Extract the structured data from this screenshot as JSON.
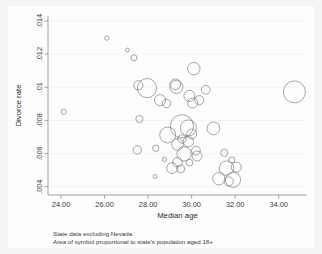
{
  "chart_data": {
    "type": "scatter",
    "title": "",
    "xlabel": "Median age",
    "ylabel": "Divorce rate",
    "xlim": [
      23.4,
      35.3
    ],
    "ylim": [
      0.0035,
      0.0143
    ],
    "xticks": [
      "24.00",
      "26.00",
      "28.00",
      "30.00",
      "32.00",
      "34.00"
    ],
    "xtick_values": [
      24,
      26,
      28,
      30,
      32,
      34
    ],
    "yticks": [
      ".014",
      ".012",
      ".01",
      ".008",
      ".006",
      ".004"
    ],
    "ytick_values": [
      0.014,
      0.012,
      0.01,
      0.008,
      0.006,
      0.004
    ],
    "grid": true,
    "legend": "none",
    "size_encoding": "Area of symbol proportional to state's population aged 18+",
    "notes": [
      "State data excluding Nevada",
      "Area of symbol proportional to state's population aged 18+"
    ],
    "marker": "open-circle",
    "marker_color": "#6f6f74",
    "background_color": "#f4f4f4",
    "plot_background_color": "#fdfdfd",
    "points": [
      {
        "x": 26.1,
        "y": 0.01297,
        "r": 2.2
      },
      {
        "x": 27.05,
        "y": 0.01225,
        "r": 1.9
      },
      {
        "x": 27.35,
        "y": 0.01178,
        "r": 3.0
      },
      {
        "x": 30.1,
        "y": 0.01112,
        "r": 6.2
      },
      {
        "x": 27.55,
        "y": 0.01012,
        "r": 4.6
      },
      {
        "x": 27.95,
        "y": 0.00995,
        "r": 9.6
      },
      {
        "x": 29.25,
        "y": 0.01018,
        "r": 5.4
      },
      {
        "x": 29.3,
        "y": 0.01002,
        "r": 6.6
      },
      {
        "x": 30.65,
        "y": 0.00985,
        "r": 4.4
      },
      {
        "x": 34.72,
        "y": 0.00972,
        "r": 11.0
      },
      {
        "x": 29.9,
        "y": 0.00948,
        "r": 5.6
      },
      {
        "x": 30.35,
        "y": 0.00922,
        "r": 4.6
      },
      {
        "x": 28.55,
        "y": 0.00922,
        "r": 5.6
      },
      {
        "x": 28.85,
        "y": 0.00902,
        "r": 4.2
      },
      {
        "x": 30.05,
        "y": 0.00905,
        "r": 5.0
      },
      {
        "x": 24.12,
        "y": 0.00852,
        "r": 2.6
      },
      {
        "x": 27.6,
        "y": 0.00808,
        "r": 3.6
      },
      {
        "x": 29.55,
        "y": 0.00765,
        "r": 11.6
      },
      {
        "x": 29.85,
        "y": 0.00755,
        "r": 8.0
      },
      {
        "x": 31.0,
        "y": 0.00752,
        "r": 6.4
      },
      {
        "x": 28.9,
        "y": 0.00712,
        "r": 8.0
      },
      {
        "x": 30.0,
        "y": 0.00718,
        "r": 5.0
      },
      {
        "x": 29.55,
        "y": 0.00688,
        "r": 4.2
      },
      {
        "x": 29.85,
        "y": 0.00672,
        "r": 5.2
      },
      {
        "x": 29.35,
        "y": 0.00655,
        "r": 5.8
      },
      {
        "x": 28.35,
        "y": 0.00632,
        "r": 3.2
      },
      {
        "x": 27.5,
        "y": 0.00622,
        "r": 4.2
      },
      {
        "x": 30.2,
        "y": 0.00618,
        "r": 4.4
      },
      {
        "x": 29.65,
        "y": 0.00598,
        "r": 7.2
      },
      {
        "x": 30.25,
        "y": 0.00585,
        "r": 5.0
      },
      {
        "x": 28.75,
        "y": 0.00565,
        "r": 2.2
      },
      {
        "x": 29.35,
        "y": 0.00548,
        "r": 4.8
      },
      {
        "x": 29.9,
        "y": 0.00545,
        "r": 3.4
      },
      {
        "x": 31.5,
        "y": 0.00605,
        "r": 3.6
      },
      {
        "x": 31.85,
        "y": 0.00562,
        "r": 3.0
      },
      {
        "x": 29.1,
        "y": 0.00512,
        "r": 5.4
      },
      {
        "x": 29.5,
        "y": 0.00508,
        "r": 4.0
      },
      {
        "x": 31.6,
        "y": 0.00512,
        "r": 7.2
      },
      {
        "x": 32.05,
        "y": 0.00518,
        "r": 5.0
      },
      {
        "x": 28.32,
        "y": 0.00462,
        "r": 2.0
      },
      {
        "x": 31.25,
        "y": 0.00448,
        "r": 6.2
      },
      {
        "x": 31.9,
        "y": 0.00442,
        "r": 7.6
      },
      {
        "x": 31.7,
        "y": 0.00432,
        "r": 4.6
      }
    ]
  },
  "axis": {
    "x_title": "Median age",
    "y_title": "Divorce rate"
  },
  "caption": {
    "line1": "State data excluding Nevada",
    "line2": "Area of symbol proportional to state's population aged 18+"
  }
}
